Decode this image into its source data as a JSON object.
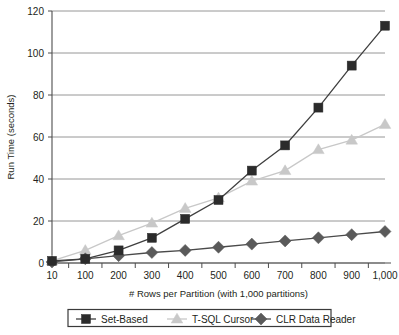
{
  "chart_data": {
    "type": "line",
    "title": "",
    "subtitle": "",
    "xlabel": "# Rows per Partition (with 1,000 partitions)",
    "ylabel": "Run Time (seconds)",
    "categories": [
      "10",
      "100",
      "200",
      "300",
      "400",
      "500",
      "600",
      "700",
      "800",
      "900",
      "1,000"
    ],
    "ylim": [
      0,
      120
    ],
    "yticks": [
      "0",
      "20",
      "40",
      "60",
      "80",
      "100",
      "120"
    ],
    "ytick_values": [
      0,
      20,
      40,
      60,
      80,
      100,
      120
    ],
    "grid": "horizontal",
    "legend_position": "bottom",
    "series": [
      {
        "name": "Set-Based",
        "marker": "square",
        "color": "#2b2b2b",
        "line_color": "#3f3f3f",
        "values": [
          1,
          2,
          6,
          12,
          21,
          30,
          44,
          56,
          74,
          94,
          113
        ]
      },
      {
        "name": "T-SQL Cursor",
        "marker": "triangle",
        "color": "#c8c8c8",
        "line_color": "#c8c8c8",
        "values": [
          1,
          6,
          13,
          19,
          26,
          31,
          39,
          44,
          54,
          58.5,
          66
        ]
      },
      {
        "name": "CLR Data Reader",
        "marker": "diamond",
        "color": "#5a5a5a",
        "line_color": "#4a4a4a",
        "values": [
          0.5,
          2,
          3.5,
          5,
          6,
          7.5,
          9,
          10.5,
          12,
          13.5,
          15
        ]
      }
    ]
  },
  "legend": {
    "items": [
      {
        "label": "Set-Based"
      },
      {
        "label": "T-SQL Cursor"
      },
      {
        "label": "CLR Data Reader"
      }
    ]
  }
}
